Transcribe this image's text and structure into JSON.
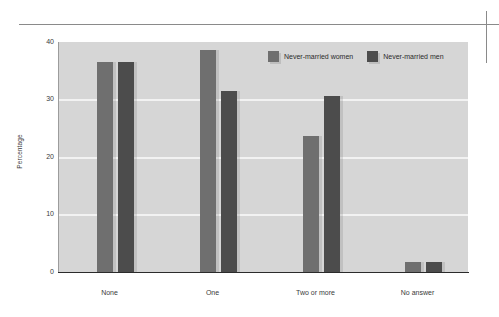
{
  "chart_data": {
    "type": "bar",
    "title": "",
    "subtitle": "",
    "xlabel": "",
    "ylabel": "Percentage",
    "categories": [
      "None",
      "One",
      "Two or more",
      "No answer"
    ],
    "series": [
      {
        "name": "Never-married women",
        "color": "#6f6f6f",
        "values": [
          36.5,
          38.6,
          23.6,
          1.7
        ]
      },
      {
        "name": "Never-married men",
        "color": "#4c4c4c",
        "values": [
          36.5,
          31.5,
          30.6,
          1.7
        ]
      }
    ],
    "ylim": [
      0,
      40
    ],
    "yticks": [
      0,
      10,
      20,
      30,
      40
    ],
    "ytick_labels": [
      "0",
      "10",
      "20",
      "30",
      "40"
    ],
    "grid": "horizontal-only",
    "legend_position": "top-center-right",
    "plot_background": "#d6d6d6",
    "gridline_color": "#f2f2f2"
  },
  "axis": {
    "y_title": "Percentage",
    "y_tick_labels": [
      "40",
      "30",
      "20",
      "10",
      "0"
    ],
    "x_tick_labels": [
      "None",
      "One",
      "Two or more",
      "No answer"
    ]
  },
  "legend": {
    "items": [
      {
        "label": "Never-married women",
        "color": "#6f6f6f"
      },
      {
        "label": "Never-married men",
        "color": "#4c4c4c"
      }
    ]
  }
}
